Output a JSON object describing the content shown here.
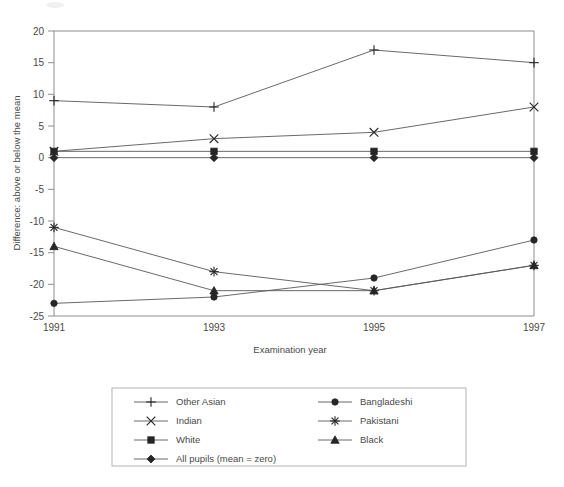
{
  "chart_data": {
    "type": "line",
    "title": "",
    "xlabel": "Examination year",
    "ylabel": "Difference: above or below the mean",
    "x": [
      1991,
      1993,
      1995,
      1997
    ],
    "xticklabels": [
      "1991",
      "1993",
      "1995",
      "1997"
    ],
    "yticks": [
      -25,
      -20,
      -15,
      -10,
      -5,
      0,
      5,
      10,
      15,
      20
    ],
    "yticklabels": [
      "-25",
      "-20",
      "-15",
      "-10",
      "-5",
      "0",
      "5",
      "10",
      "15",
      "20"
    ],
    "ylim": [
      -25,
      20
    ],
    "xlim": [
      1991,
      1997
    ],
    "grid": false,
    "legend_position": "below-center",
    "series": [
      {
        "name": "Other Asian",
        "marker": "plus",
        "values": [
          9,
          8,
          17,
          15
        ]
      },
      {
        "name": "Bangladeshi",
        "marker": "circle",
        "values": [
          -23,
          -22,
          -19,
          -13
        ]
      },
      {
        "name": "Indian",
        "marker": "cross",
        "values": [
          1,
          3,
          4,
          8
        ]
      },
      {
        "name": "Pakistani",
        "marker": "star",
        "values": [
          -11,
          -18,
          -21,
          -17
        ]
      },
      {
        "name": "White",
        "marker": "square",
        "values": [
          1,
          1,
          1,
          1
        ]
      },
      {
        "name": "Black",
        "marker": "triangle",
        "values": [
          -14,
          -21,
          -21,
          -17
        ]
      },
      {
        "name": "All pupils (mean = zero)",
        "marker": "diamond",
        "values": [
          0,
          0,
          0,
          0
        ]
      }
    ]
  },
  "axes": {
    "ylabel": "Difference: above or below the mean",
    "xlabel": "Examination year",
    "yticklabels": [
      "20",
      "15",
      "10",
      "5",
      "0",
      "-5",
      "-10",
      "-15",
      "-20",
      "-25"
    ],
    "xticklabels": [
      "1991",
      "1993",
      "1995",
      "1997"
    ]
  },
  "legend": {
    "column_left": [
      {
        "label": "Other Asian",
        "marker": "plus-marker"
      },
      {
        "label": "Indian",
        "marker": "cross-marker"
      },
      {
        "label": "White",
        "marker": "square-marker"
      },
      {
        "label": "All pupils (mean = zero)",
        "marker": "diamond-marker"
      }
    ],
    "column_right": [
      {
        "label": "Bangladeshi",
        "marker": "circle-marker"
      },
      {
        "label": "Pakistani",
        "marker": "star-marker"
      },
      {
        "label": "Black",
        "marker": "triangle-marker"
      }
    ]
  },
  "colors": {
    "line": "#585858",
    "marker": "#262626",
    "axis": "#8d8d8d",
    "text": "#4a4a4a",
    "legend_border": "#b4b4b4",
    "background": "#ffffff"
  }
}
